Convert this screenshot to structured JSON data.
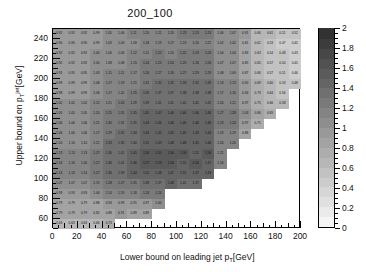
{
  "chart_data": {
    "type": "heatmap",
    "title": "200_100",
    "xlabel": "Lower bound on leading jet p_T [GeV]",
    "ylabel": "Upper bound on p_T^{jet} [GeV]",
    "xlim": [
      0,
      200
    ],
    "ylim": [
      50,
      250
    ],
    "zlim": [
      0,
      2
    ],
    "colormap": "grayscale",
    "grid": false,
    "legend_position": "right-colorbar",
    "xticks": [
      0,
      20,
      40,
      60,
      80,
      100,
      120,
      140,
      160,
      180,
      200
    ],
    "yticks": [
      60,
      80,
      100,
      120,
      140,
      160,
      180,
      200,
      220,
      240
    ],
    "zticks": [
      0,
      0.2,
      0.4,
      0.6,
      0.8,
      1,
      1.2,
      1.4,
      1.6,
      1.8,
      2
    ],
    "cell_size": {
      "x": 10,
      "y": 10
    },
    "x_bin_edges": [
      0,
      10,
      20,
      30,
      40,
      50,
      60,
      70,
      80,
      90,
      100,
      110,
      120,
      130,
      140,
      150,
      160,
      170,
      180,
      190,
      200
    ],
    "y_bin_edges": [
      50,
      60,
      70,
      80,
      90,
      100,
      110,
      120,
      130,
      140,
      150,
      160,
      170,
      180,
      190,
      200,
      210,
      220,
      230,
      240,
      250
    ],
    "rows": [
      {
        "y": 245,
        "values": [
          0.92,
          0.92,
          0.92,
          0.99,
          1.05,
          1.06,
          1.11,
          1.2,
          1.21,
          1.2,
          1.23,
          1.23,
          1.23,
          1.06,
          1.07,
          0.91,
          0.66,
          0.61,
          0.51,
          0.52
        ]
      },
      {
        "y": 235,
        "values": [
          0.9,
          0.9,
          0.9,
          0.99,
          1.03,
          1.03,
          1.09,
          1.18,
          1.19,
          1.17,
          1.19,
          1.2,
          1.21,
          1.02,
          1.02,
          0.81,
          0.61,
          0.53,
          0.47,
          0.45
        ]
      },
      {
        "y": 225,
        "values": [
          0.92,
          0.92,
          0.92,
          1.0,
          1.06,
          1.06,
          1.12,
          1.21,
          1.22,
          1.2,
          1.22,
          1.23,
          1.24,
          1.04,
          1.04,
          0.83,
          0.63,
          0.54,
          0.48,
          0.43
        ]
      },
      {
        "y": 215,
        "values": [
          0.92,
          0.92,
          0.92,
          1.0,
          1.08,
          1.08,
          1.15,
          1.24,
          1.25,
          1.24,
          1.25,
          1.26,
          1.26,
          1.07,
          1.07,
          0.85,
          0.65,
          0.57,
          0.5,
          0.45
        ]
      },
      {
        "y": 205,
        "values": [
          0.95,
          0.95,
          0.95,
          1.03,
          1.11,
          1.11,
          1.17,
          1.26,
          1.27,
          1.26,
          1.27,
          1.29,
          1.29,
          1.08,
          1.09,
          0.87,
          0.66,
          0.57,
          0.51,
          0.46
        ]
      },
      {
        "y": 195,
        "values": [
          0.99,
          0.99,
          0.99,
          1.08,
          1.17,
          1.19,
          1.21,
          1.31,
          1.32,
          1.32,
          1.33,
          1.32,
          1.33,
          1.13,
          1.13,
          0.9,
          0.69,
          0.6,
          0.53,
          0.48
        ]
      },
      {
        "y": 185,
        "values": [
          0.98,
          0.99,
          0.99,
          1.08,
          1.17,
          1.2,
          1.25,
          1.35,
          1.37,
          1.37,
          1.38,
          1.38,
          1.38,
          1.17,
          1.16,
          0.94,
          0.73,
          0.64,
          0.56
        ]
      },
      {
        "y": 175,
        "values": [
          1.02,
          1.02,
          1.02,
          1.12,
          1.21,
          1.24,
          1.29,
          1.39,
          1.41,
          1.41,
          1.42,
          1.41,
          1.42,
          1.2,
          1.21,
          0.97,
          0.75,
          0.66,
          0.58
        ]
      },
      {
        "y": 165,
        "values": [
          1.05,
          1.05,
          1.05,
          1.2,
          1.25,
          1.31,
          1.35,
          1.45,
          1.47,
          1.46,
          1.46,
          1.46,
          1.46,
          1.27,
          1.28,
          1.03,
          0.8,
          0.69
        ]
      },
      {
        "y": 155,
        "values": [
          1.06,
          1.06,
          1.06,
          1.21,
          1.3,
          1.31,
          1.35,
          1.44,
          1.46,
          1.46,
          1.46,
          1.46,
          1.46,
          1.23,
          1.24,
          0.97,
          0.71
        ]
      },
      {
        "y": 145,
        "values": [
          1.06,
          1.06,
          1.06,
          1.17,
          1.29,
          1.32,
          1.34,
          1.44,
          1.45,
          1.45,
          1.45,
          1.43,
          1.44,
          1.19,
          1.19,
          0.88
        ]
      },
      {
        "y": 135,
        "values": [
          1.1,
          1.1,
          1.1,
          1.21,
          1.33,
          1.35,
          1.4,
          1.51,
          1.49,
          1.48,
          1.48,
          1.45,
          1.46,
          1.2,
          1.2
        ]
      },
      {
        "y": 125,
        "values": [
          1.13,
          1.13,
          1.13,
          1.27,
          1.36,
          1.41,
          1.45,
          1.56,
          1.55,
          1.56,
          1.56,
          1.52,
          1.56,
          1.21
        ]
      },
      {
        "y": 115,
        "values": [
          1.16,
          1.16,
          1.16,
          1.27,
          1.36,
          1.41,
          1.46,
          1.57,
          1.53,
          1.54,
          1.52,
          1.56,
          1.47,
          1.16
        ]
      },
      {
        "y": 105,
        "values": [
          1.14,
          1.14,
          1.14,
          1.27,
          1.36,
          1.39,
          1.44,
          1.52,
          1.48,
          1.47,
          1.51,
          1.47,
          1.43
        ]
      },
      {
        "y": 95,
        "values": [
          1.07,
          1.07,
          1.07,
          1.19,
          1.28,
          1.27,
          1.31,
          1.38,
          1.37,
          1.48,
          1.41,
          1.37
        ]
      },
      {
        "y": 85,
        "values": [
          0.93,
          0.93,
          0.93,
          1.06,
          1.14,
          1.19,
          1.16,
          1.24,
          1.24
        ]
      },
      {
        "y": 75,
        "values": [
          0.79,
          0.79,
          0.79,
          0.88,
          0.94,
          0.93,
          0.91,
          0.97,
          1.0
        ]
      },
      {
        "y": 65,
        "values": [
          0.79,
          0.79,
          0.79,
          0.82,
          0.88,
          0.91,
          0.89,
          0.89
        ]
      },
      {
        "y": 55,
        "values": [
          0.63,
          0.63,
          0.63,
          0.66,
          0.73
        ]
      }
    ]
  }
}
